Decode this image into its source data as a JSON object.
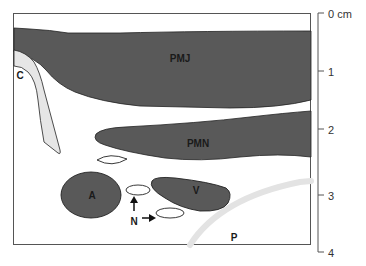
{
  "diagram": {
    "colors": {
      "muscle": "#595959",
      "cartilage": "#e6e6e6",
      "outline": "#222222",
      "pleura": "#e3e3e3",
      "frame": "#555555",
      "background": "#ffffff"
    },
    "structures": [
      {
        "id": "PMJ",
        "label": "PMJ"
      },
      {
        "id": "PMN",
        "label": "PMN"
      },
      {
        "id": "C",
        "label": "C"
      },
      {
        "id": "A",
        "label": "A"
      },
      {
        "id": "V",
        "label": "V"
      },
      {
        "id": "N",
        "label": "N"
      },
      {
        "id": "P",
        "label": "P"
      }
    ],
    "scale": {
      "unit": "cm",
      "ticks": [
        {
          "value": "0 cm"
        },
        {
          "value": "1"
        },
        {
          "value": "2"
        },
        {
          "value": "3"
        },
        {
          "value": "4"
        }
      ]
    }
  }
}
